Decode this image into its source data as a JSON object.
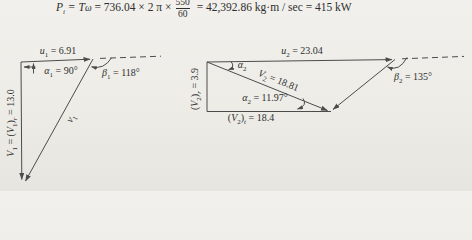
{
  "theme": {
    "background": "#edece7",
    "ink": "#4c4c4c",
    "text": "#2e2e2e"
  },
  "equation": {
    "P": "P",
    "P_sub": "i",
    "eqT": " = T",
    "omega": "ω",
    "mid": " = 736.04 × 2 π ×",
    "frac_num": "550",
    "frac_den": "60",
    "tail": " = 42,392.86 kg·m / sec = 415 kW"
  },
  "diagram1": {
    "u_label": {
      "base": "u",
      "sub": "1",
      "rest": " = 6.91"
    },
    "alpha_label": {
      "base": "α",
      "sub": "1",
      "rest": " = 90°"
    },
    "beta_label": {
      "base": "β",
      "sub": "1",
      "rest": " = 118°"
    },
    "rel_label": {
      "base": "v",
      "sub": "1"
    },
    "abs_label": {
      "p1": "V",
      "s1": "1",
      "p2": " = (",
      "p3": "V",
      "s2": "1",
      "p4": ")",
      "s3": "r",
      "p5": " = 13.0"
    }
  },
  "diagram2": {
    "u_label": {
      "base": "u",
      "sub": "2",
      "rest": " = 23.04"
    },
    "alpha_arc_label": {
      "base": "α",
      "sub": "2"
    },
    "abs_label": {
      "base": "V",
      "sub": "2",
      "rest": " = 18.81"
    },
    "alpha_label": {
      "base": "α",
      "sub": "2",
      "rest": " = 11.97°"
    },
    "beta_label": {
      "base": "β",
      "sub": "2",
      "rest": " = 135°"
    },
    "tangential_label": {
      "p1": "(",
      "p2": "V",
      "s1": "2",
      "p3": ")",
      "s2": "t",
      "p4": " = 18.4"
    },
    "radial_label": {
      "p1": "(",
      "p2": "V",
      "s1": "2",
      "p3": ")",
      "s2": "r",
      "p4": " = 3.9"
    }
  }
}
